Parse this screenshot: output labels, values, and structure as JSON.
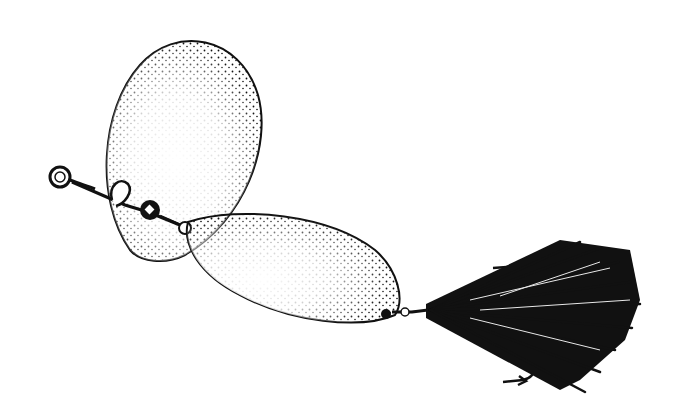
{
  "image": {
    "subject": "Tandem-blade spinner fishing lure, black-and-white stippled line illustration",
    "background_color": "#ffffff",
    "ink_color": "#111111",
    "parts": [
      {
        "name": "line-tie-eye",
        "description": "round wire eye at left end"
      },
      {
        "name": "front-blade",
        "description": "large teardrop (Colorado) blade, stippled"
      },
      {
        "name": "clevis",
        "description": "wire clevis loop attaching front blade"
      },
      {
        "name": "bead",
        "description": "small black bead on shaft"
      },
      {
        "name": "rear-blade",
        "description": "elongated willow-leaf blade, stippled"
      },
      {
        "name": "treble-hook",
        "description": "hook points visible above and below tail"
      },
      {
        "name": "tail",
        "description": "black hair/feather dressing fanning to the right"
      }
    ]
  }
}
